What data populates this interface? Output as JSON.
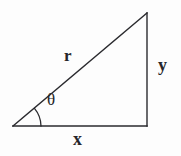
{
  "figure": {
    "name": "right-triangle-polar-coordinates",
    "type": "geometric-diagram",
    "background_color": "#fdfdfd",
    "stroke_color": "#2a2a2e",
    "stroke_width": 1.4,
    "labels": {
      "hypotenuse": "r",
      "vertical_leg": "y",
      "horizontal_leg": "x",
      "angle": "θ"
    },
    "label_positions": {
      "hypotenuse": {
        "x": 71,
        "y": 56
      },
      "vertical_leg": {
        "x": 165,
        "y": 66
      },
      "horizontal_leg": {
        "x": 80,
        "y": 140
      },
      "angle": {
        "x": 54,
        "y": 101
      }
    },
    "vertices": {
      "origin": {
        "x": 13,
        "y": 126
      },
      "right_angle": {
        "x": 147,
        "y": 126
      },
      "apex": {
        "x": 147,
        "y": 13
      }
    },
    "angle_arc": {
      "center": {
        "x": 13,
        "y": 126
      },
      "radius": 28,
      "start_degrees": 0,
      "end_degrees": 40
    }
  }
}
